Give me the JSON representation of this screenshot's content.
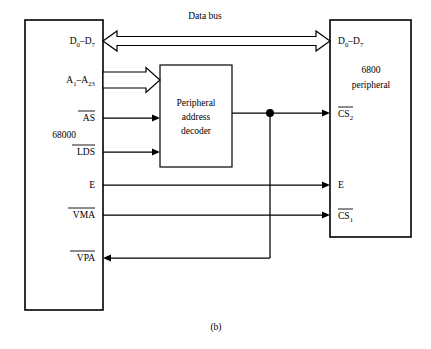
{
  "figure": {
    "caption": "(b)",
    "data_bus_label": "Data bus"
  },
  "cpu_block": {
    "name": "68000",
    "pins": {
      "data": {
        "text": "D",
        "sub1": "0",
        "dash": "–",
        "text2": "D",
        "sub2": "7"
      },
      "address": {
        "text": "A",
        "sub1": "1",
        "dash": "–",
        "text2": "A",
        "sub2": "23"
      },
      "as": "AS",
      "lds": "LDS",
      "e": "E",
      "vma": "VMA",
      "vpa": "VPA"
    }
  },
  "decoder_block": {
    "line1": "Peripheral",
    "line2": "address",
    "line3": "decoder"
  },
  "peripheral_block": {
    "name_line1": "6800",
    "name_line2": "peripheral",
    "pins": {
      "data": {
        "text": "D",
        "sub1": "0",
        "dash": "–",
        "text2": "D",
        "sub2": "7"
      },
      "cs2": {
        "text": "CS",
        "sub": "2"
      },
      "e": "E",
      "cs1": {
        "text": "CS",
        "sub": "1"
      }
    }
  },
  "colors": {
    "line": "#000000",
    "background": "#ffffff"
  }
}
